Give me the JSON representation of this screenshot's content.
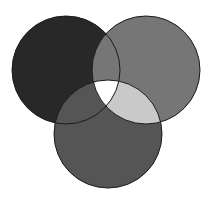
{
  "figure": {
    "name": "three-circle-venn-diagram",
    "type": "venn",
    "width": 211,
    "height": 204,
    "background_color": "#ffffff",
    "stroke_color": "#1c1c1c",
    "stroke_width": 1
  },
  "chart_data": {
    "type": "venn",
    "title": "",
    "subtitle": "",
    "xlabel": "",
    "ylabel": "",
    "grid": false,
    "legend": "none",
    "annotations": [],
    "sets": [
      {
        "id": "set-a",
        "label": "",
        "position": "top-left",
        "center_x": 66,
        "center_y": 70,
        "radius": 54,
        "fill": "#282828",
        "draw_order": 1
      },
      {
        "id": "set-b",
        "label": "",
        "position": "top-right",
        "center_x": 146,
        "center_y": 70,
        "radius": 54,
        "fill": "#767676",
        "draw_order": 2
      },
      {
        "id": "set-c",
        "label": "",
        "position": "bottom-center",
        "center_x": 108,
        "center_y": 134,
        "radius": 54,
        "fill": "#555555",
        "draw_order": 3
      }
    ],
    "regions": [
      {
        "id": "region-a-only",
        "sets": [
          "set-a"
        ],
        "fill": "#282828"
      },
      {
        "id": "region-b-only",
        "sets": [
          "set-b"
        ],
        "fill": "#767676"
      },
      {
        "id": "region-c-only",
        "sets": [
          "set-c"
        ],
        "fill": "#555555"
      },
      {
        "id": "region-ab",
        "sets": [
          "set-a",
          "set-b"
        ],
        "fill": "#767676"
      },
      {
        "id": "region-ac",
        "sets": [
          "set-a",
          "set-c"
        ],
        "fill": "#555555"
      },
      {
        "id": "region-bc",
        "sets": [
          "set-b",
          "set-c"
        ],
        "fill": "#c9c9c9"
      },
      {
        "id": "region-abc",
        "sets": [
          "set-a",
          "set-b",
          "set-c"
        ],
        "fill": "#ffffff"
      }
    ]
  }
}
